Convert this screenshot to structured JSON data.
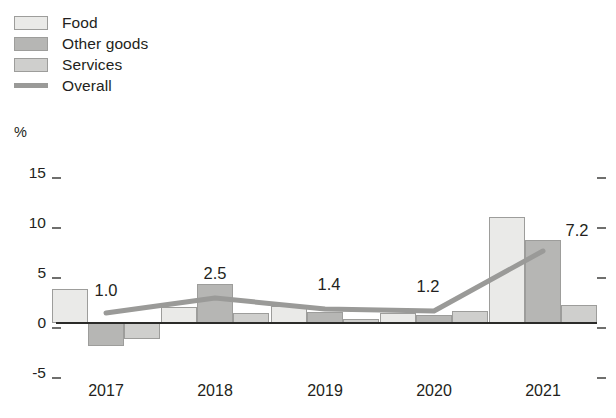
{
  "legend": {
    "items": [
      {
        "label": "Food",
        "type": "swatch",
        "color": "#eaeae8",
        "name": "legend-item-food"
      },
      {
        "label": "Other goods",
        "type": "swatch",
        "color": "#b6b6b4",
        "name": "legend-item-other-goods"
      },
      {
        "label": "Services",
        "type": "swatch",
        "color": "#cfcfcd",
        "name": "legend-item-services"
      },
      {
        "label": "Overall",
        "type": "line",
        "color": "#9a9a98",
        "name": "legend-item-overall"
      }
    ]
  },
  "axis": {
    "unit": "%",
    "y_ticks": [
      "15",
      "10",
      "5",
      "0",
      "-5"
    ],
    "x_ticks": [
      "2017",
      "2018",
      "2019",
      "2020",
      "2021"
    ]
  },
  "chart_data": {
    "type": "bar",
    "title": "",
    "xlabel": "",
    "ylabel": "%",
    "ylim": [
      -5,
      15
    ],
    "yticks": [
      15,
      10,
      5,
      0,
      -5
    ],
    "grid": false,
    "legend_position": "top-left",
    "categories": [
      "2017",
      "2018",
      "2019",
      "2020",
      "2021"
    ],
    "series": [
      {
        "name": "Food",
        "type": "bar",
        "color": "#eaeae8",
        "values": [
          3.4,
          1.6,
          1.7,
          1.0,
          10.6
        ]
      },
      {
        "name": "Other goods",
        "type": "bar",
        "color": "#b6b6b4",
        "values": [
          -2.3,
          3.9,
          1.1,
          0.8,
          8.3
        ]
      },
      {
        "name": "Services",
        "type": "bar",
        "color": "#cfcfcd",
        "values": [
          -1.6,
          1.0,
          0.4,
          1.2,
          1.8
        ]
      },
      {
        "name": "Overall",
        "type": "line",
        "color": "#9a9a98",
        "values": [
          1.0,
          2.5,
          1.4,
          1.2,
          7.2
        ]
      }
    ],
    "data_labels": [
      {
        "category": "2017",
        "value": "1.0"
      },
      {
        "category": "2018",
        "value": "2.5"
      },
      {
        "category": "2019",
        "value": "1.4"
      },
      {
        "category": "2020",
        "value": "1.2"
      },
      {
        "category": "2021",
        "value": "7.2"
      }
    ]
  }
}
